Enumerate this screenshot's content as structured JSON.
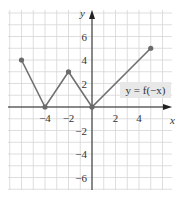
{
  "chart_data": {
    "type": "line",
    "title": "",
    "xlabel": "x",
    "ylabel": "y",
    "xlim": [
      -7,
      7
    ],
    "ylim": [
      -7,
      8
    ],
    "grid": true,
    "xticks": [
      -4,
      -2,
      2,
      4
    ],
    "yticks": [
      6,
      4,
      2,
      -2,
      -4,
      -6
    ],
    "series": [
      {
        "name": "y = f(−x)",
        "points": [
          [
            -6,
            4
          ],
          [
            -4,
            0
          ],
          [
            -2,
            3
          ],
          [
            0,
            0
          ],
          [
            5,
            5
          ]
        ],
        "markers": true
      }
    ],
    "annotations": [
      {
        "text": "y = f(−x)",
        "position": [
          4.3,
          1.2
        ]
      }
    ]
  },
  "colors": {
    "line": "#707070",
    "marker": "#6a6a6a",
    "grid": "#d6d6d6",
    "axis": "#222222",
    "label_bg": "#e8e8e8"
  },
  "labels": {
    "x_axis": "x",
    "y_axis": "y",
    "curve": "y = f(−x)"
  }
}
